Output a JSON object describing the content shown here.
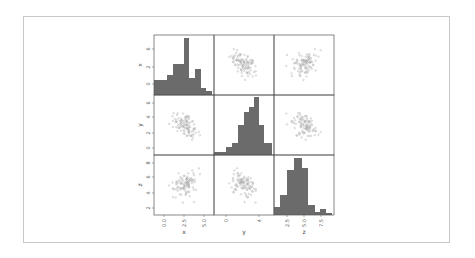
{
  "chart_data": {
    "type": "scatter_matrix",
    "variables": [
      "x",
      "y",
      "z"
    ],
    "diagonal": "hist",
    "colors": {
      "bars": "#6b6b6b",
      "points": "#a8a8a8",
      "frame": "#c8c8c8",
      "axes": "#555555"
    },
    "axes": {
      "x": {
        "ticks": [
          "0.0",
          "2.5",
          "5.0"
        ],
        "range": [
          -1.5,
          6.5
        ]
      },
      "y": {
        "ticks": [
          "0",
          "4"
        ],
        "row_ticks": [
          "0",
          "2",
          "4",
          "6"
        ],
        "range": [
          -2.5,
          7
        ]
      },
      "z": {
        "ticks": [
          "2.5",
          "5.0",
          "7.5"
        ],
        "row_ticks": [
          "2",
          "4",
          "6",
          "8"
        ],
        "range": [
          1,
          9
        ]
      }
    },
    "row_tick_labels": {
      "x": [
        "6",
        "2",
        "0"
      ],
      "y": [
        "6",
        "4",
        "2",
        "0"
      ],
      "z": [
        "8",
        "6",
        "4",
        "2"
      ]
    },
    "histograms": {
      "x": {
        "bin_edges_px": [
          0,
          13,
          19,
          30,
          35,
          41,
          47,
          52,
          58
        ],
        "heights_rel": [
          15,
          20,
          31,
          57,
          17,
          26,
          7,
          4
        ]
      },
      "y": {
        "bin_edges_px": [
          0,
          12,
          18,
          24,
          30,
          35,
          40,
          45,
          50,
          58
        ],
        "heights_rel": [
          3,
          8,
          12,
          30,
          43,
          48,
          58,
          30,
          12,
          3
        ]
      },
      "z": {
        "bin_edges_px": [
          0,
          6,
          13,
          20,
          28,
          34,
          41,
          46,
          52,
          58
        ],
        "heights_rel": [
          8,
          20,
          45,
          57,
          47,
          10,
          3,
          6,
          2
        ]
      }
    },
    "correlations_visual": {
      "x_y": "negative",
      "x_z": "weak positive",
      "y_z": "negative"
    },
    "n_points": 100,
    "title": "",
    "legend": null,
    "grid": false
  }
}
